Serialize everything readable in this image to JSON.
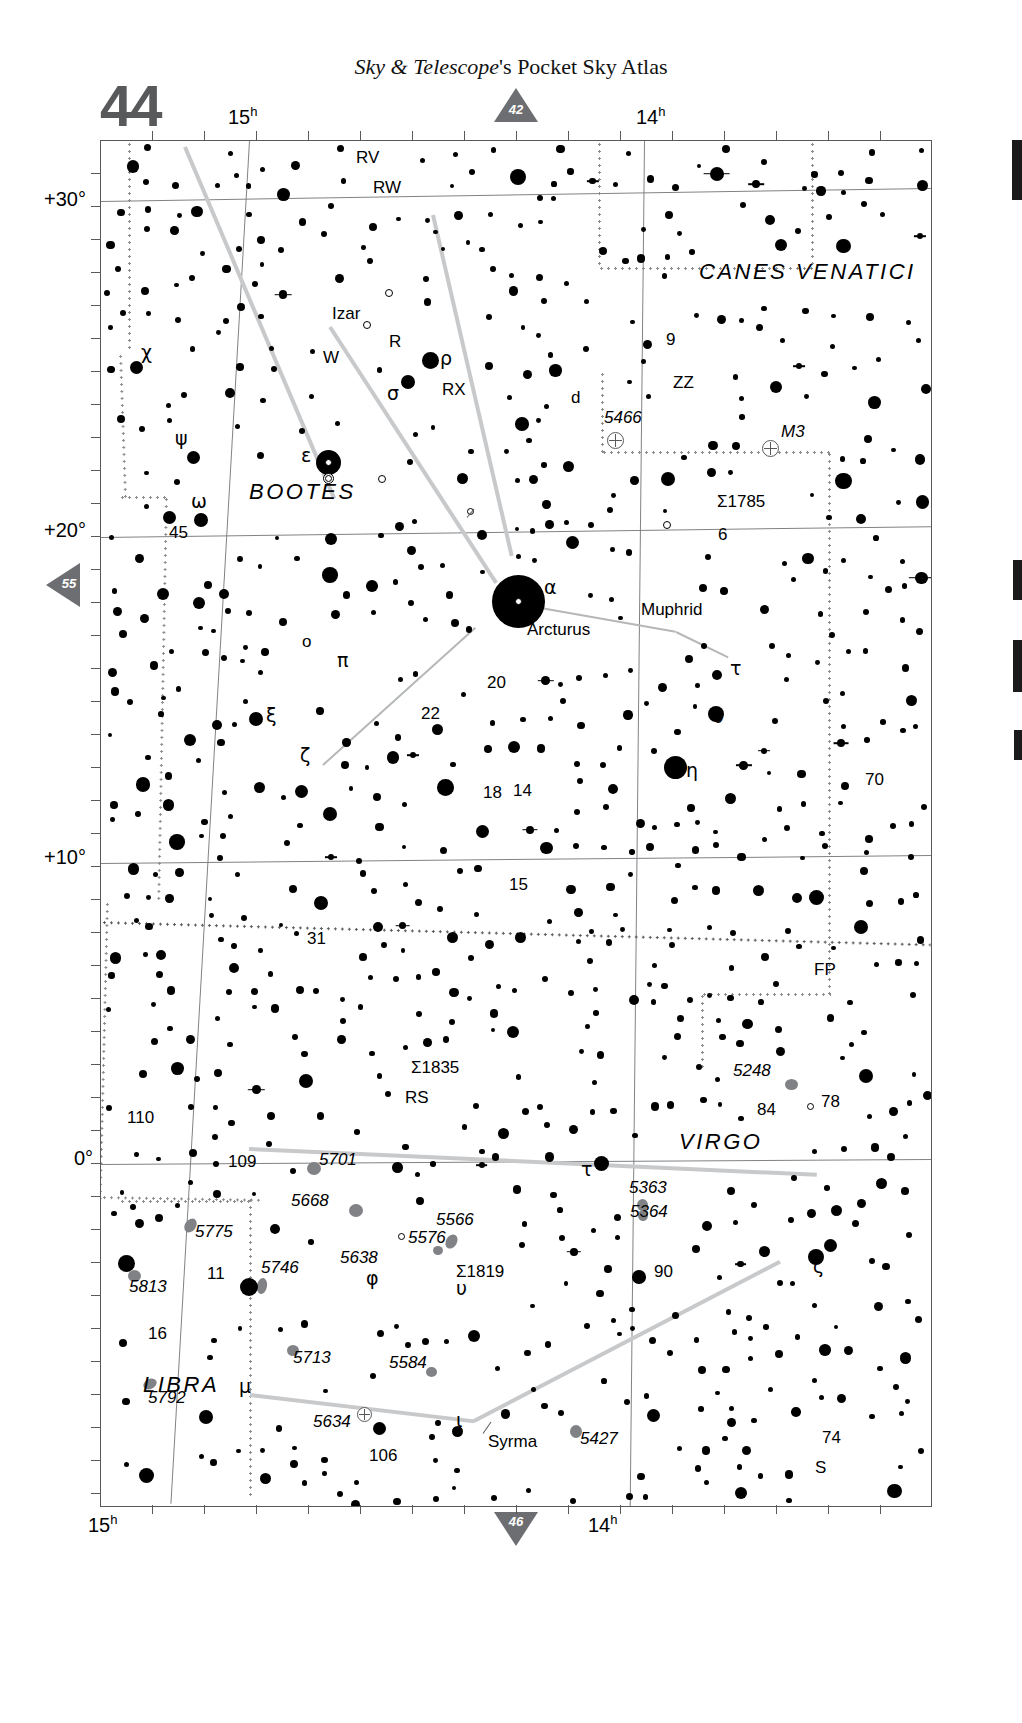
{
  "header": {
    "publication_italic": "Sky & Telescope",
    "publication_rest": "'s Pocket Sky Atlas",
    "page_number": "44"
  },
  "page_links": {
    "top": "42",
    "bottom": "46",
    "left": "55"
  },
  "chart_data": {
    "type": "scatter",
    "xlabel": "Right Ascension",
    "ylabel": "Declination",
    "x_ticks_top": [
      "15h",
      "14h"
    ],
    "x_ticks_bottom": [
      "15h",
      "14h"
    ],
    "y_ticks": [
      "+30°",
      "+20°",
      "+10°",
      "0°"
    ],
    "grid": true,
    "legend": "none",
    "constellations": [
      {
        "name": "BOOTES",
        "x": 290,
        "y": 490
      },
      {
        "name": "CANES VENATICI",
        "x": 810,
        "y": 272
      },
      {
        "name": "VIRGO",
        "x": 720,
        "y": 1143
      },
      {
        "name": "LIBRA",
        "x": 175,
        "y": 1385
      }
    ],
    "stars": [
      {
        "label": "χ",
        "x": 136,
        "y": 228,
        "mag": 4.5
      },
      {
        "label": "ψ",
        "x": 193,
        "y": 316,
        "mag": 4.5
      },
      {
        "label": "ω",
        "x": 200,
        "y": 379,
        "mag": 4.6
      },
      {
        "label": "45",
        "x": 173,
        "y": 379,
        "mag": 4.8
      },
      {
        "label": "ρ",
        "x": 429,
        "y": 219,
        "mag": 3.6
      },
      {
        "label": "σ",
        "x": 406,
        "y": 241,
        "mag": 4.4
      },
      {
        "label": "ε",
        "x": 327,
        "y": 322,
        "mag": 2.4,
        "name": "Izar"
      },
      {
        "label": "ν",
        "x": 481,
        "y": 394,
        "mag": 5.0
      },
      {
        "label": "d",
        "x": 573,
        "y": 402,
        "mag": 4.8
      },
      {
        "label": "9",
        "x": 667,
        "y": 338,
        "mag": 5.0
      },
      {
        "label": "6",
        "x": 718,
        "y": 535,
        "mag": 4.9
      },
      {
        "label": "ξ",
        "x": 256,
        "y": 578,
        "mag": 4.5
      },
      {
        "label": "22",
        "x": 437,
        "y": 589,
        "mag": 5.4
      },
      {
        "label": "α",
        "x": 517,
        "y": 600,
        "mag": -0.05,
        "name": "Arcturus"
      },
      {
        "label": "η",
        "x": 675,
        "y": 629,
        "mag": 2.7,
        "name": "Muphrid"
      },
      {
        "label": "τ",
        "x": 730,
        "y": 657,
        "mag": 4.5
      },
      {
        "label": "υ",
        "x": 716,
        "y": 713,
        "mag": 4.1
      },
      {
        "label": "o",
        "x": 301,
        "y": 650,
        "mag": 4.6
      },
      {
        "label": "π",
        "x": 329,
        "y": 672,
        "mag": 4.5
      },
      {
        "label": "20",
        "x": 481,
        "y": 690,
        "mag": 4.9
      },
      {
        "label": "ζ",
        "x": 320,
        "y": 762,
        "mag": 3.8
      },
      {
        "label": "18",
        "x": 487,
        "y": 798,
        "mag": 5.4
      },
      {
        "label": "14",
        "x": 517,
        "y": 796,
        "mag": 5.5
      },
      {
        "label": "70",
        "x": 862,
        "y": 785,
        "mag": 5.0
      },
      {
        "label": "15",
        "x": 512,
        "y": 890,
        "mag": 5.3
      },
      {
        "label": "31",
        "x": 305,
        "y": 940,
        "mag": 4.9
      },
      {
        "label": "110",
        "x": 126,
        "y": 1122,
        "mag": 4.4
      },
      {
        "label": "109",
        "x": 248,
        "y": 1146,
        "mag": 3.7
      },
      {
        "label": "84",
        "x": 765,
        "y": 1110,
        "mag": 5.4
      },
      {
        "label": "78",
        "x": 828,
        "y": 1104,
        "mag": 4.9
      },
      {
        "label": "τ",
        "x": 600,
        "y": 1160,
        "mag": 4.3
      },
      {
        "label": "ζ",
        "x": 814,
        "y": 1254,
        "mag": 3.4
      },
      {
        "label": "11",
        "x": 206,
        "y": 1275,
        "mag": 5.2
      },
      {
        "label": "φ",
        "x": 380,
        "y": 1287,
        "mag": 4.8
      },
      {
        "label": "υ",
        "x": 459,
        "y": 1290,
        "mag": 5.1
      },
      {
        "label": "90",
        "x": 654,
        "y": 1273,
        "mag": 5.1
      },
      {
        "label": "16",
        "x": 146,
        "y": 1334,
        "mag": 4.5
      },
      {
        "label": "μ",
        "x": 249,
        "y": 1392,
        "mag": 3.9
      },
      {
        "label": "ι",
        "x": 473,
        "y": 1418,
        "mag": 4.1,
        "name": "Syrma"
      },
      {
        "label": "106",
        "x": 371,
        "y": 1453,
        "mag": 5.4
      },
      {
        "label": "74",
        "x": 833,
        "y": 1440,
        "mag": 4.7
      },
      {
        "label": "S",
        "x": 830,
        "y": 1466,
        "mag": 7.0
      }
    ],
    "variable_stars": [
      {
        "label": "RV",
        "x": 388,
        "y": 154
      },
      {
        "label": "RW",
        "x": 368,
        "y": 185
      },
      {
        "label": "W",
        "x": 333,
        "y": 337
      },
      {
        "label": "R",
        "x": 381,
        "y": 338
      },
      {
        "label": "RX",
        "x": 470,
        "y": 379
      },
      {
        "label": "ZZ",
        "x": 668,
        "y": 384
      },
      {
        "label": "FP",
        "x": 806,
        "y": 966
      },
      {
        "label": "RS",
        "x": 402,
        "y": 1093
      }
    ],
    "deep_sky": [
      {
        "label": "5466",
        "type": "globular",
        "x": 612,
        "y": 297
      },
      {
        "label": "M3",
        "type": "globular",
        "x": 767,
        "y": 305
      },
      {
        "label": "Σ1785",
        "type": "double",
        "x": 730,
        "y": 364
      },
      {
        "label": "Σ1835",
        "type": "double",
        "x": 442,
        "y": 931
      },
      {
        "label": "5248",
        "type": "galaxy",
        "x": 790,
        "y": 944
      },
      {
        "label": "5701",
        "type": "galaxy",
        "x": 312,
        "y": 1026
      },
      {
        "label": "5668",
        "type": "galaxy",
        "x": 354,
        "y": 1068
      },
      {
        "label": "5566",
        "type": "galaxy",
        "x": 451,
        "y": 1098
      },
      {
        "label": "5576",
        "type": "galaxy",
        "x": 437,
        "y": 1110
      },
      {
        "label": "5363",
        "type": "galaxy",
        "x": 641,
        "y": 1063
      },
      {
        "label": "5364",
        "type": "galaxy",
        "x": 643,
        "y": 1073
      },
      {
        "label": "5775",
        "type": "galaxy",
        "x": 190,
        "y": 1082
      },
      {
        "label": "5746",
        "type": "galaxy",
        "x": 262,
        "y": 1144
      },
      {
        "label": "5638",
        "type": "galaxy",
        "x": 384,
        "y": 1108
      },
      {
        "label": "Σ1819",
        "type": "double",
        "x": 452,
        "y": 1122
      },
      {
        "label": "5813",
        "type": "galaxy",
        "x": 133,
        "y": 1135
      },
      {
        "label": "5713",
        "type": "galaxy",
        "x": 291,
        "y": 1208
      },
      {
        "label": "5584",
        "type": "galaxy",
        "x": 427,
        "y": 1232
      },
      {
        "label": "5792",
        "type": "galaxy",
        "x": 146,
        "y": 1245
      },
      {
        "label": "5812",
        "type": "galaxy",
        "x": 110,
        "y": 1431
      },
      {
        "label": "5634",
        "type": "globular",
        "x": 362,
        "y": 1412
      },
      {
        "label": "5427",
        "type": "galaxy",
        "x": 574,
        "y": 1430
      }
    ],
    "named_stars": [
      {
        "name": "Izar",
        "x": 345,
        "y": 310
      },
      {
        "name": "Arcturus",
        "x": 560,
        "y": 629
      },
      {
        "name": "Muphrid",
        "x": 679,
        "y": 610
      },
      {
        "name": "Syrma",
        "x": 492,
        "y": 1440
      }
    ]
  }
}
